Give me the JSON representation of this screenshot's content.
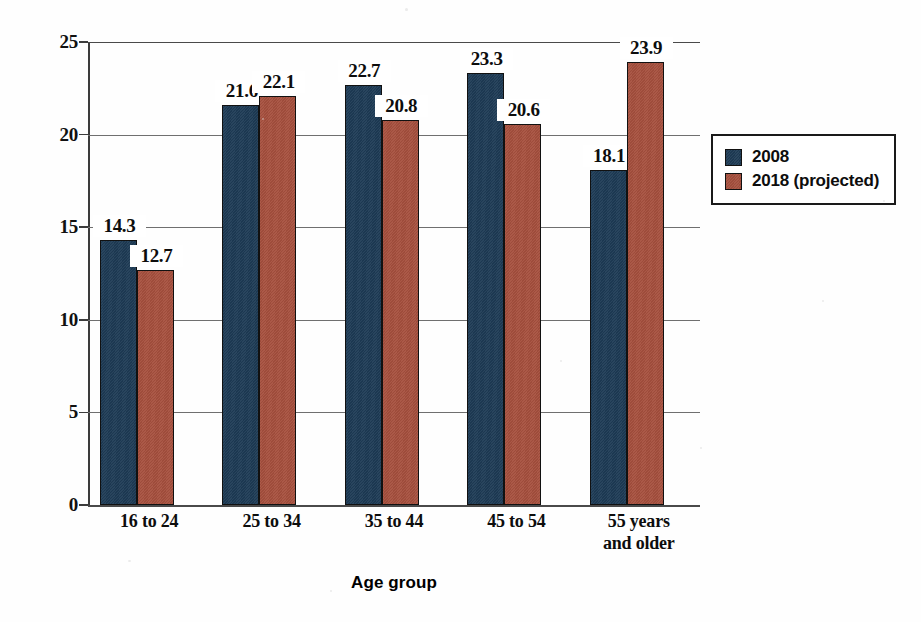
{
  "chart_data": {
    "type": "bar",
    "title": "",
    "xlabel": "Age group",
    "ylabel": "",
    "ylim": [
      0,
      25
    ],
    "yticks": [
      "0",
      "5",
      "10",
      "15",
      "20",
      "25"
    ],
    "grid": true,
    "legend_position": "right",
    "categories": [
      "16 to 24",
      "25 to 34",
      "35 to 44",
      "45 to 54",
      "55 years\nand older"
    ],
    "category_lines": [
      [
        "16 to 24"
      ],
      [
        "25 to 34"
      ],
      [
        "35 to 44"
      ],
      [
        "45 to 54"
      ],
      [
        "55 years",
        "and older"
      ]
    ],
    "series": [
      {
        "name": "2008",
        "color": "#1e3b55",
        "values": [
          14.3,
          21.6,
          22.7,
          23.3,
          18.1
        ],
        "labels": [
          "14.3",
          "21.6",
          "22.7",
          "23.3",
          "18.1"
        ]
      },
      {
        "name": "2018 (projected)",
        "color": "#a6503e",
        "values": [
          12.7,
          22.1,
          20.8,
          20.6,
          23.9
        ],
        "labels": [
          "12.7",
          "22.1",
          "20.8",
          "20.6",
          "23.9"
        ]
      }
    ]
  },
  "axis": {
    "x_title": "Age group",
    "y_ticks": [
      "25",
      "20",
      "15",
      "10",
      "5",
      "0"
    ]
  },
  "legend": {
    "items": [
      {
        "label": "2008",
        "color": "#1e3b55"
      },
      {
        "label": "2018 (projected)",
        "color": "#a6503e"
      }
    ]
  },
  "title_remnant": ""
}
